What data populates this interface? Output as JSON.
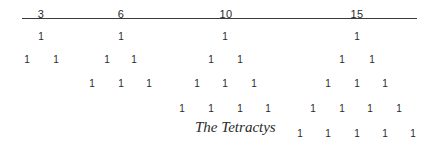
{
  "caption": "The Tetractys",
  "triangular_numbers": [
    {
      "label": "3",
      "x": 41
    },
    {
      "label": "6",
      "x": 121
    },
    {
      "label": "10",
      "x": 226
    },
    {
      "label": "15",
      "x": 357
    }
  ],
  "dot_glyph": "1",
  "rows": {
    "row1": {
      "y": 37,
      "xs": [
        41,
        121,
        225,
        357
      ]
    },
    "row2": {
      "y": 60,
      "xs": [
        27,
        56,
        107,
        134,
        211,
        240,
        342,
        372
      ]
    },
    "row3": {
      "y": 84,
      "xs": [
        92,
        121,
        149,
        197,
        225,
        254,
        328,
        357,
        385
      ]
    },
    "row4": {
      "y": 109,
      "xs": [
        182,
        211,
        240,
        268,
        313,
        342,
        370,
        399
      ]
    },
    "row5": {
      "y": 134,
      "xs": [
        300,
        328,
        357,
        385,
        413
      ]
    }
  },
  "figures": [
    {
      "name": "triangle-3",
      "total": "3",
      "rows": [
        [
          "1"
        ],
        [
          "1",
          "1"
        ]
      ]
    },
    {
      "name": "triangle-6",
      "total": "6",
      "rows": [
        [
          "1"
        ],
        [
          "1",
          "1"
        ],
        [
          "1",
          "1",
          "1"
        ]
      ]
    },
    {
      "name": "triangle-10",
      "total": "10",
      "rows": [
        [
          "1"
        ],
        [
          "1",
          "1"
        ],
        [
          "1",
          "1",
          "1"
        ],
        [
          "1",
          "1",
          "1",
          "1"
        ]
      ]
    },
    {
      "name": "triangle-15",
      "total": "15",
      "rows": [
        [
          "1"
        ],
        [
          "1",
          "1"
        ],
        [
          "1",
          "1",
          "1"
        ],
        [
          "1",
          "1",
          "1",
          "1"
        ],
        [
          "1",
          "1",
          "1",
          "1",
          "1"
        ]
      ]
    }
  ]
}
